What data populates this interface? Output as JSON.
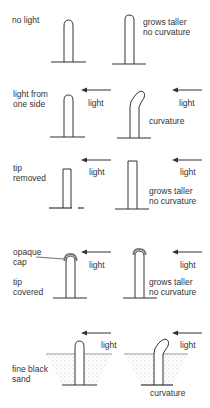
{
  "rows": [
    {
      "condition": "no light",
      "left_label": "",
      "right_label": "",
      "result": "grows taller\nno curvature"
    },
    {
      "condition": "light from\none side",
      "left_label": "light",
      "right_label": "light",
      "result": "curvature"
    },
    {
      "condition": "tip\nremoved",
      "left_label": "light",
      "right_label": "light",
      "result": "grows taller\nno curvature"
    },
    {
      "condition": "tip\ncovered",
      "annotation": "opaque\ncap",
      "left_label": "light",
      "right_label": "light",
      "result": "grows taller\nno curvature"
    },
    {
      "condition": "fine black\nsand",
      "left_label": "light",
      "right_label": "light",
      "result": "curvature"
    }
  ],
  "colors": {
    "line": "#333333",
    "sand": "#c8c8c8",
    "cap": "#777777"
  }
}
